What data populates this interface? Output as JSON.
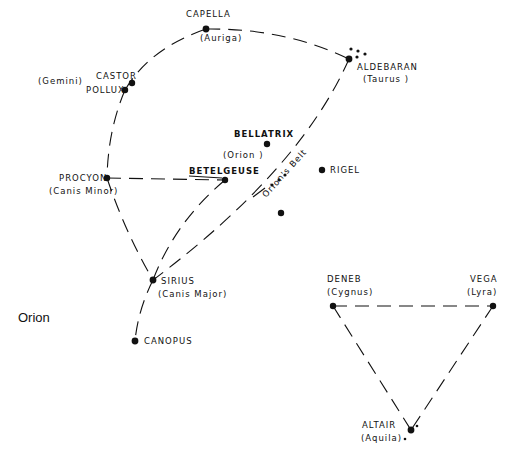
{
  "title": "Orion",
  "stars": [
    {
      "id": "capella",
      "name": "CAPELLA",
      "constellation": "(Auriga)"
    },
    {
      "id": "castor",
      "name": "CASTOR",
      "constellation": "(Gemini)"
    },
    {
      "id": "pollux",
      "name": "POLLUX",
      "constellation": ""
    },
    {
      "id": "aldebaran",
      "name": "ALDEBARAN",
      "constellation": "(Taurus )"
    },
    {
      "id": "bellatrix",
      "name": "BELLATRIX",
      "constellation": "(Orion )"
    },
    {
      "id": "betelgeuse",
      "name": "BETELGEUSE",
      "constellation": ""
    },
    {
      "id": "procyon",
      "name": "PROCYON",
      "constellation": "(Canis Minor)"
    },
    {
      "id": "rigel",
      "name": "RIGEL",
      "constellation": ""
    },
    {
      "id": "sirius",
      "name": "SIRIUS",
      "constellation": "(Canis Major)"
    },
    {
      "id": "canopus",
      "name": "CANOPUS",
      "constellation": ""
    },
    {
      "id": "deneb",
      "name": "DENEB",
      "constellation": "(Cygnus)"
    },
    {
      "id": "vega",
      "name": "VEGA",
      "constellation": "(Lyra)"
    },
    {
      "id": "altair",
      "name": "ALTAIR",
      "constellation": "(Aquila)"
    }
  ],
  "annotations": {
    "orions_belt": "Orion's Belt"
  },
  "connections": [
    [
      "pollux",
      "capella"
    ],
    [
      "capella",
      "aldebaran"
    ],
    [
      "pollux",
      "procyon"
    ],
    [
      "procyon",
      "betelgeuse"
    ],
    [
      "procyon",
      "sirius"
    ],
    [
      "betelgeuse",
      "sirius"
    ],
    [
      "aldebaran",
      "sirius"
    ],
    [
      "sirius",
      "canopus"
    ],
    [
      "deneb",
      "vega"
    ],
    [
      "deneb",
      "altair"
    ],
    [
      "vega",
      "altair"
    ]
  ]
}
